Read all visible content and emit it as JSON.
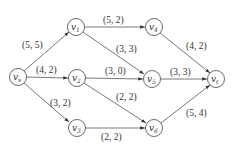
{
  "diagram": {
    "type": "flow-network",
    "nodes": [
      {
        "id": "vs",
        "base": "v",
        "sub": "s",
        "x": 18,
        "y": 77
      },
      {
        "id": "v1",
        "base": "v",
        "sub": "1",
        "x": 76,
        "y": 27
      },
      {
        "id": "v2",
        "base": "v",
        "sub": "2",
        "x": 77,
        "y": 78
      },
      {
        "id": "v3",
        "base": "v",
        "sub": "3",
        "x": 77,
        "y": 128
      },
      {
        "id": "v4",
        "base": "v",
        "sub": "4",
        "x": 154,
        "y": 27
      },
      {
        "id": "v5",
        "base": "v",
        "sub": "5",
        "x": 152,
        "y": 79
      },
      {
        "id": "v6",
        "base": "v",
        "sub": "6",
        "x": 154,
        "y": 128
      },
      {
        "id": "vt",
        "base": "v",
        "sub": "t",
        "x": 216,
        "y": 79
      }
    ],
    "edges": [
      {
        "from": "vs",
        "to": "v1",
        "label": "(5, 5)"
      },
      {
        "from": "vs",
        "to": "v2",
        "label": "(4, 2)"
      },
      {
        "from": "vs",
        "to": "v3",
        "label": "(3, 2)"
      },
      {
        "from": "v1",
        "to": "v4",
        "label": "(5, 2)"
      },
      {
        "from": "v1",
        "to": "v5",
        "label": "(3, 3)"
      },
      {
        "from": "v2",
        "to": "v5",
        "label": "(3, 0)"
      },
      {
        "from": "v2",
        "to": "v6",
        "label": "(2, 2)"
      },
      {
        "from": "v3",
        "to": "v6",
        "label": "(2, 2)"
      },
      {
        "from": "v4",
        "to": "vt",
        "label": "(4, 2)"
      },
      {
        "from": "v5",
        "to": "vt",
        "label": "(3, 3)"
      },
      {
        "from": "v6",
        "to": "vt",
        "label": "(5, 4)"
      }
    ]
  }
}
